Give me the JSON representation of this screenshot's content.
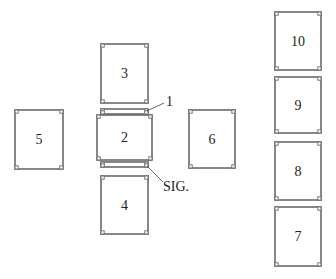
{
  "diagram": {
    "title": "",
    "cards": [
      {
        "id": "3",
        "label": "3",
        "x": 101,
        "y": 44,
        "w": 47,
        "h": 59
      },
      {
        "id": "2",
        "label": "2",
        "x": 97,
        "y": 115,
        "w": 55,
        "h": 45
      },
      {
        "id": "4",
        "label": "4",
        "x": 101,
        "y": 176,
        "w": 47,
        "h": 58
      },
      {
        "id": "5",
        "label": "5",
        "x": 15,
        "y": 110,
        "w": 48,
        "h": 59
      },
      {
        "id": "6",
        "label": "6",
        "x": 189,
        "y": 110,
        "w": 46,
        "h": 58
      },
      {
        "id": "10",
        "label": "10",
        "x": 275,
        "y": 12,
        "w": 46,
        "h": 58
      },
      {
        "id": "9",
        "label": "9",
        "x": 275,
        "y": 77,
        "w": 46,
        "h": 56
      },
      {
        "id": "8",
        "label": "8",
        "x": 275,
        "y": 142,
        "w": 46,
        "h": 58
      },
      {
        "id": "7",
        "label": "7",
        "x": 275,
        "y": 207,
        "w": 46,
        "h": 59
      }
    ],
    "strips": [
      {
        "id": "1",
        "x": 101,
        "y": 109,
        "w": 47,
        "h": 5
      },
      {
        "id": "sig",
        "x": 101,
        "y": 162,
        "w": 47,
        "h": 5
      }
    ],
    "callouts": [
      {
        "id": "card-1",
        "text": "1",
        "x1": 147,
        "y1": 111,
        "x2": 164,
        "y2": 103,
        "tx": 166,
        "ty": 106
      },
      {
        "id": "significator",
        "text": "SIG.",
        "x1": 147,
        "y1": 166,
        "x2": 163,
        "y2": 182,
        "tx": 163,
        "ty": 191
      }
    ]
  }
}
